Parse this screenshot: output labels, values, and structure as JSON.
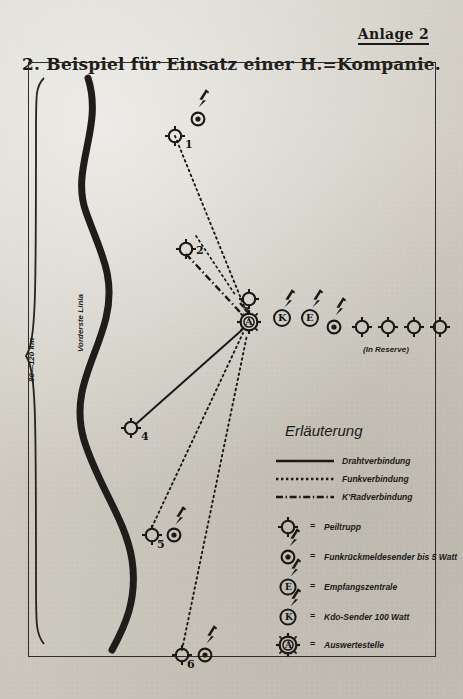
{
  "header": {
    "annex_label": "Anlage 2"
  },
  "title": "2. Beispiel für Einsatz einer H.=Kompanie.",
  "map": {
    "front_line_label": "Vorderste Linia",
    "depth_scale_label": "80—120 km",
    "reserve_label": "(In Reserve)",
    "stations": [
      {
        "id": "1",
        "label": "1"
      },
      {
        "id": "2",
        "label": "2"
      },
      {
        "id": "3",
        "label": "3"
      },
      {
        "id": "4",
        "label": "4"
      },
      {
        "id": "5",
        "label": "5"
      },
      {
        "id": "6",
        "label": "6"
      }
    ],
    "hub_symbols": [
      {
        "id": "K",
        "label": "K"
      },
      {
        "id": "E",
        "label": "E"
      },
      {
        "id": "A",
        "label": "A"
      }
    ]
  },
  "legend": {
    "title": "Erläuterung",
    "lines": [
      {
        "style": "solid",
        "label": "Drahtverbindung"
      },
      {
        "style": "dotted",
        "label": "Funkverbindung"
      },
      {
        "style": "dashdot",
        "label": "K'Radverbindung"
      }
    ],
    "equals": "=",
    "symbols": [
      {
        "glyph": "peiltrupp",
        "letter": "",
        "label": "Peiltrupp"
      },
      {
        "glyph": "sender-dot",
        "letter": "",
        "label": "Funkrückmeldesender bis 5 Watt"
      },
      {
        "glyph": "circle-e",
        "letter": "E",
        "label": "Empfangszentrale"
      },
      {
        "glyph": "circle-k",
        "letter": "K",
        "label": "Kdo-Sender 100 Watt"
      },
      {
        "glyph": "circle-a",
        "letter": "A",
        "label": "Auswertestelle"
      }
    ]
  },
  "colors": {
    "ink": "#1b1916",
    "paper": "#d2cec5",
    "frame": "#2e2c28"
  }
}
